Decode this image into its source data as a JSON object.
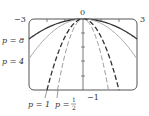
{
  "diagram": {
    "title": "",
    "x_range": [
      -3,
      3
    ],
    "y_range": [
      -1,
      0
    ],
    "axis_labels": {
      "x_min": "−3",
      "x_max": "3",
      "y_top": "0",
      "y_bottom": "−1"
    },
    "curves": [
      {
        "p": 8,
        "label": "p = 8",
        "style": "solid",
        "color": "#333333",
        "width": 1.3
      },
      {
        "p": 4,
        "label": "p = 4",
        "style": "solid",
        "color": "#aaaaaa",
        "width": 1.0
      },
      {
        "p": 1,
        "label": "p = 1",
        "style": "dashed",
        "color": "#333333",
        "width": 1.3
      },
      {
        "p": 0.5,
        "label": "p = ½",
        "style": "dashed",
        "color": "#999999",
        "width": 1.0
      }
    ],
    "labels": {
      "p8_text": "p = 8",
      "p4_text": "p = 4",
      "p1_text": "p = 1",
      "phalf_prefix": "p = ",
      "phalf_num": "1",
      "phalf_den": "2"
    },
    "equation_form": "y = -x^2 / (4p)"
  }
}
